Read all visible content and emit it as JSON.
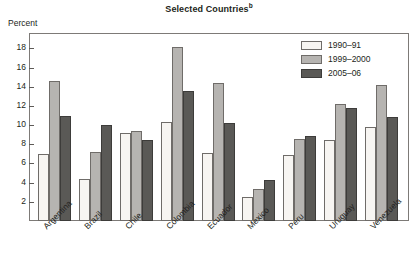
{
  "chart_data": {
    "type": "bar",
    "title": "Selected Countries",
    "title_superscript": "b",
    "xlabel": "",
    "ylabel": "Percent",
    "ylim": [
      0,
      19.5
    ],
    "yticks": [
      2,
      4,
      6,
      8,
      10,
      12,
      14,
      16,
      18
    ],
    "grid": false,
    "legend_position": "top-right",
    "categories": [
      "Argentina",
      "Brazil",
      "Chile",
      "Colombia",
      "Ecuador",
      "Mexico",
      "Peru",
      "Uruguay",
      "Venezuela"
    ],
    "series": [
      {
        "name": "1990–91",
        "color": "#f7f5f2",
        "values": [
          7.0,
          4.4,
          9.2,
          10.3,
          7.1,
          2.5,
          6.9,
          8.5,
          9.8
        ]
      },
      {
        "name": "1999–2000",
        "color": "#b6b4b1",
        "values": [
          14.6,
          7.2,
          9.4,
          18.1,
          14.4,
          3.3,
          8.6,
          12.2,
          14.2
        ]
      },
      {
        "name": "2005–06",
        "color": "#5a5956",
        "values": [
          11.0,
          10.0,
          8.4,
          13.6,
          10.2,
          4.3,
          8.9,
          11.8,
          10.8
        ]
      }
    ]
  }
}
